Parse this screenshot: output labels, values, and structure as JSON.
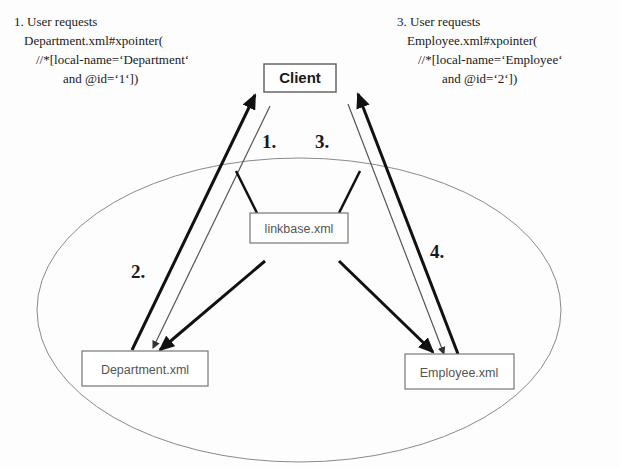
{
  "diagram": {
    "nodes": {
      "client": {
        "label": "Client"
      },
      "linkbase": {
        "label": "linkbase.xml"
      },
      "department": {
        "label": "Department.xml"
      },
      "employee": {
        "label": "Employee.xml"
      }
    },
    "steps": {
      "s1": "1.",
      "s2": "2.",
      "s3": "3.",
      "s4": "4."
    },
    "annotations": {
      "left": {
        "line1": "1. User requests",
        "line2": "Department.xml#xpointer(",
        "line3": "//*[local-name=‘Department‘",
        "line4": "and @id=‘1‘])"
      },
      "right": {
        "line1": "3. User requests",
        "line2": "Employee.xml#xpointer(",
        "line3": "//*[local-name=‘Employee‘",
        "line4": "and @id=‘2‘])"
      }
    },
    "colors": {
      "stroke": "#111111",
      "thin": "#666666",
      "ellipse": "#888888",
      "box": "#777777"
    }
  }
}
